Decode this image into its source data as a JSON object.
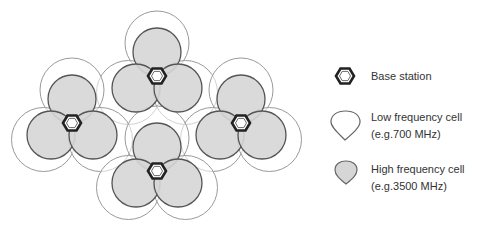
{
  "diagram": {
    "colors": {
      "high_fill": "#d6d6d6",
      "high_stroke": "#555555",
      "low_fill": "#ffffff",
      "low_stroke": "#9a9a9a",
      "station_stroke": "#222222",
      "text": "#333333"
    },
    "sites": [
      {
        "name": "top",
        "x": 157,
        "y": 76
      },
      {
        "name": "left",
        "x": 72,
        "y": 123
      },
      {
        "name": "right",
        "x": 241,
        "y": 123
      },
      {
        "name": "bottom",
        "x": 157,
        "y": 171
      }
    ],
    "high_radius": 24,
    "low_radius": 32
  },
  "legend": {
    "base_station": {
      "label": "Base station",
      "icon": "hexagon-icon"
    },
    "low_frequency": {
      "label": "Low frequency cell",
      "sublabel": "(e.g.700 MHz)",
      "icon": "teardrop-outline-icon"
    },
    "high_frequency": {
      "label": "High frequency cell",
      "sublabel": "(e.g.3500 MHz)",
      "icon": "teardrop-filled-icon"
    }
  }
}
